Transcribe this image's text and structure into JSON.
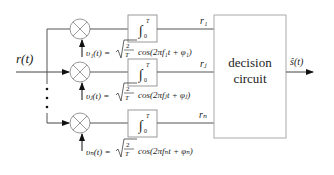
{
  "diagram": {
    "type": "block-diagram",
    "input": {
      "label": "r(t)"
    },
    "output": {
      "label": "ŝ(t)"
    },
    "decision_block": {
      "line1": "decision",
      "line2": "circuit"
    },
    "branches": [
      {
        "id": "1",
        "carrier_lhs": "υ₁(t) =",
        "carrier_rhs": "cos(2πf₁t + φ₁)",
        "integral_upper": "T",
        "integral_lower": "0",
        "integrator_symbol": "∫",
        "output_label": "r₁"
      },
      {
        "id": "j",
        "carrier_lhs": "υⱼ(t) =",
        "carrier_rhs": "cos(2πfⱼt + φⱼ)",
        "integral_upper": "T",
        "integral_lower": "0",
        "integrator_symbol": "∫",
        "output_label": "rⱼ"
      },
      {
        "id": "n",
        "carrier_lhs": "υₙ(t) =",
        "carrier_rhs": "cos(2πfₙt + φₙ)",
        "integral_upper": "T",
        "integral_lower": "0",
        "integrator_symbol": "∫",
        "output_label": "rₙ"
      }
    ],
    "sqrt_numerator": "2",
    "sqrt_denominator": "T",
    "ellipsis": "⋮",
    "colors": {
      "line": "#444444",
      "box_border": "#999999",
      "multiplier_border": "#999999",
      "text": "#222222"
    }
  }
}
